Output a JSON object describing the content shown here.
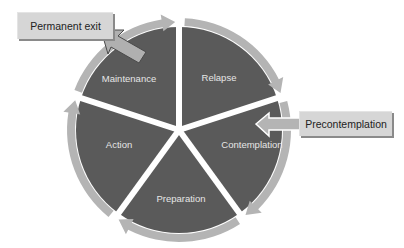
{
  "diagram": {
    "segments": [
      {
        "label": "Relapse"
      },
      {
        "label": "Contemplation"
      },
      {
        "label": "Preparation"
      },
      {
        "label": "Action"
      },
      {
        "label": "Maintenance"
      }
    ],
    "entry_box": {
      "label": "Precontemplation",
      "arrow": "arrow-left-icon"
    },
    "exit_box": {
      "label": "Permanent exit",
      "arrow": "arrow-up-left-icon"
    },
    "colors": {
      "segment_fill": "#5a5a5a",
      "ring_fill": "#b4b4b4",
      "box_fill": "#d6d6d6",
      "separator": "#ffffff",
      "label_text": "#e6e6e6",
      "box_text": "#222222"
    }
  }
}
